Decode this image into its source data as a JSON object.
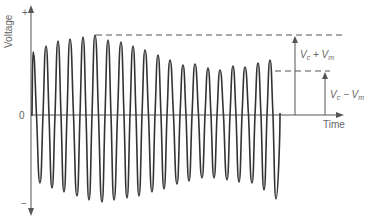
{
  "diagram": {
    "y_axis": {
      "label": "Voltage",
      "plus": "+",
      "minus": "−",
      "zero": "0"
    },
    "x_axis": {
      "label": "Time"
    },
    "annotations": {
      "max_label_main": "V",
      "max_label_sub1": "c",
      "max_label_op": " + V",
      "max_label_sub2": "m",
      "min_label_main": "V",
      "min_label_sub1": "c",
      "min_label_op": " − V",
      "min_label_sub2": "m"
    },
    "colors": {
      "wave": "#333333",
      "axis": "#555555",
      "text": "#666666"
    }
  },
  "chart_data": {
    "type": "line",
    "title": "",
    "xlabel": "Time",
    "ylabel": "Voltage",
    "peaks_px": [
      [
        33,
        52
      ],
      [
        46,
        46
      ],
      [
        58,
        41
      ],
      [
        70,
        39
      ],
      [
        83,
        37
      ],
      [
        95,
        35
      ],
      [
        108,
        40
      ],
      [
        121,
        42
      ],
      [
        133,
        46
      ],
      [
        145,
        50
      ],
      [
        158,
        55
      ],
      [
        170,
        60
      ],
      [
        183,
        65
      ],
      [
        195,
        64
      ],
      [
        208,
        68
      ],
      [
        220,
        70
      ],
      [
        233,
        66
      ],
      [
        245,
        67
      ],
      [
        258,
        63
      ],
      [
        270,
        60
      ]
    ],
    "troughs_px": [
      [
        40,
        183
      ],
      [
        52,
        188
      ],
      [
        64,
        192
      ],
      [
        77,
        196
      ],
      [
        89,
        200
      ],
      [
        102,
        202
      ],
      [
        114,
        200
      ],
      [
        127,
        198
      ],
      [
        139,
        196
      ],
      [
        152,
        192
      ],
      [
        164,
        189
      ],
      [
        177,
        184
      ],
      [
        189,
        181
      ],
      [
        202,
        178
      ],
      [
        214,
        178
      ],
      [
        227,
        180
      ],
      [
        239,
        182
      ],
      [
        252,
        183
      ],
      [
        264,
        190
      ],
      [
        276,
        199
      ]
    ],
    "zero_y_px": 115,
    "levels": {
      "Vc_plus_Vm_y_px": 35,
      "Vc_minus_Vm_y_px": 71
    }
  }
}
